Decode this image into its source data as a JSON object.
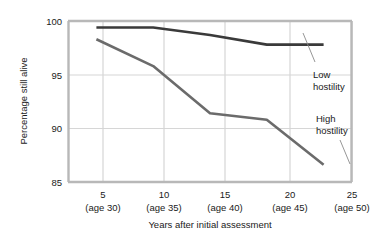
{
  "chart_data": {
    "type": "line",
    "title": "",
    "xlabel": "Years after initial assessment",
    "ylabel": "Percentage still alive",
    "x": [
      5,
      10,
      15,
      20,
      25
    ],
    "categories": [
      "5",
      "10",
      "15",
      "20",
      "25"
    ],
    "category_sublabels": [
      "(age 30)",
      "(age 35)",
      "(age 40)",
      "(age 45)",
      "(age 50)"
    ],
    "xtick_labels": [
      "5",
      "10",
      "15",
      "20",
      "25"
    ],
    "ytick_labels": [
      "100",
      "95",
      "90",
      "85"
    ],
    "yticks": [
      100,
      95,
      90,
      85
    ],
    "ylim": [
      85,
      100
    ],
    "xlim": [
      2.5,
      27.5
    ],
    "grid": true,
    "legend_position": "inline-annotation",
    "series": [
      {
        "name": "Low hostility",
        "label": "Low",
        "label_line2": "hostility",
        "values": [
          99.4,
          99.4,
          98.7,
          97.8,
          97.8
        ],
        "color": "#3a3a3a"
      },
      {
        "name": "High hostility",
        "label": "High",
        "label_line2": "hostility",
        "values": [
          98.3,
          95.8,
          91.4,
          90.8,
          86.6
        ],
        "color": "#6b6b6b"
      }
    ]
  },
  "axis": {
    "y_title": "Percentage still alive",
    "x_title": "Years after initial assessment"
  },
  "colors": {
    "background": "#ffffff",
    "axis_frame": "#b8b8b8",
    "gridline": "#d6d6d6",
    "low_hostility_line": "#3a3a3a",
    "high_hostility_line": "#6b6b6b",
    "text": "#1a1a1a",
    "leader_line": "#8a8a8a"
  }
}
